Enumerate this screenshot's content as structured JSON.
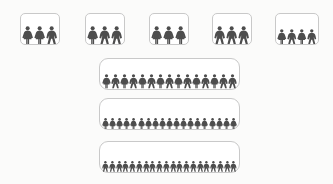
{
  "figure": {
    "icon_male": "person-male-icon",
    "icon_female": "person-female-icon",
    "colors": {
      "background": "#fbfbfa",
      "box_fill": "#ffffff",
      "box_border": "#c9c9c9",
      "figure": "#4d4d4d"
    }
  },
  "chart_data": {
    "type": "pictogram",
    "xlabel": "",
    "ylabel": "",
    "unit": "1 icon = 1 person",
    "groups": [
      {
        "name": "group-1",
        "row": "top",
        "count": 3,
        "genders": [
          "female",
          "female",
          "male"
        ],
        "box": {
          "x": 20,
          "y": 13,
          "w": 40,
          "h": 32
        }
      },
      {
        "name": "group-2",
        "row": "top",
        "count": 3,
        "genders": [
          "female",
          "male",
          "male"
        ],
        "box": {
          "x": 85,
          "y": 13,
          "w": 40,
          "h": 32
        }
      },
      {
        "name": "group-3",
        "row": "top",
        "count": 3,
        "genders": [
          "female",
          "female",
          "female"
        ],
        "box": {
          "x": 149,
          "y": 13,
          "w": 40,
          "h": 32
        }
      },
      {
        "name": "group-4",
        "row": "top",
        "count": 3,
        "genders": [
          "male",
          "male",
          "male"
        ],
        "box": {
          "x": 212,
          "y": 13,
          "w": 40,
          "h": 32
        }
      },
      {
        "name": "group-5",
        "row": "top",
        "count": 4,
        "genders": [
          "female",
          "male",
          "female",
          "male"
        ],
        "box": {
          "x": 275,
          "y": 13,
          "w": 44,
          "h": 32
        }
      },
      {
        "name": "group-6",
        "row": "wide",
        "count": 15,
        "genders": [
          "female",
          "male",
          "female",
          "male",
          "female",
          "male",
          "female",
          "male",
          "female",
          "male",
          "female",
          "male",
          "female",
          "male",
          "male"
        ],
        "box": {
          "x": 99,
          "y": 58,
          "w": 141,
          "h": 32
        }
      },
      {
        "name": "group-7",
        "row": "wide",
        "count": 19,
        "genders": [
          "female",
          "female",
          "female",
          "female",
          "female",
          "female",
          "female",
          "female",
          "female",
          "female",
          "female",
          "female",
          "female",
          "female",
          "female",
          "female",
          "female",
          "female",
          "female"
        ],
        "box": {
          "x": 99,
          "y": 98,
          "w": 141,
          "h": 32
        }
      },
      {
        "name": "group-8",
        "row": "wide",
        "count": 20,
        "genders": [
          "male",
          "male",
          "male",
          "male",
          "male",
          "male",
          "male",
          "male",
          "male",
          "male",
          "male",
          "male",
          "male",
          "male",
          "male",
          "male",
          "male",
          "male",
          "male",
          "male"
        ],
        "box": {
          "x": 99,
          "y": 141,
          "w": 141,
          "h": 32
        }
      }
    ],
    "totals": {
      "top_row_total": 16,
      "wide_rows_total": 54,
      "grand_total": 70
    }
  }
}
